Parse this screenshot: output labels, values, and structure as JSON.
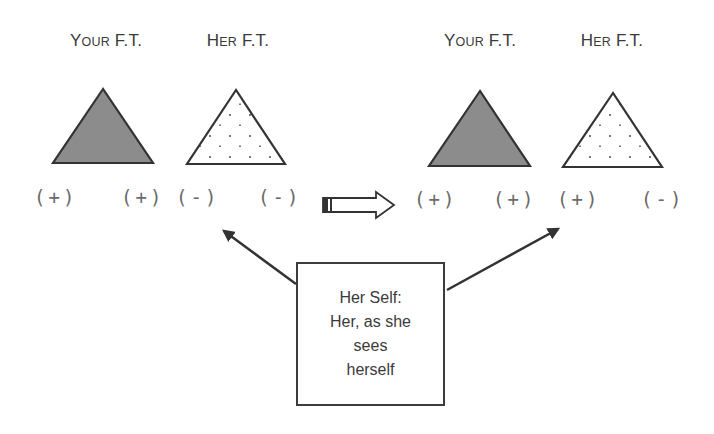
{
  "diagram": {
    "left_panel": {
      "labels": {
        "your_ft": {
          "first": "Y",
          "rest": "OUR",
          "suffix": " F.T."
        },
        "her_ft": {
          "first": "H",
          "rest": "ER",
          "suffix": " F.T."
        }
      },
      "signs": [
        "(+)",
        "(+)",
        "(-)",
        "(-)"
      ]
    },
    "right_panel": {
      "labels": {
        "your_ft": {
          "first": "Y",
          "rest": "OUR",
          "suffix": " F.T."
        },
        "her_ft": {
          "first": "H",
          "rest": "ER",
          "suffix": " F.T."
        }
      },
      "signs": [
        "(+)",
        "(+)",
        "(+)",
        "(-)"
      ]
    },
    "transition_arrow": "block-right-arrow",
    "callout": {
      "lines": [
        "Her Self:",
        "Her, as she",
        "sees",
        "herself"
      ]
    },
    "colors": {
      "dark_triangle_fill": "#8c8c8c",
      "outline": "#333333",
      "dot": "#777777",
      "sign_text": "#6a6a6a"
    }
  }
}
